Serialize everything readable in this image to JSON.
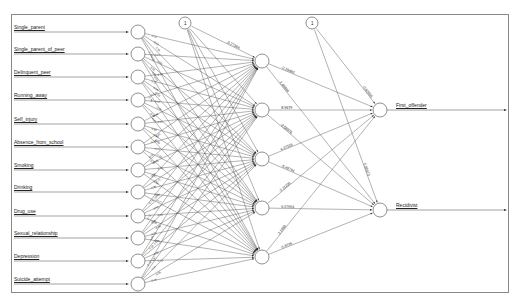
{
  "diagram": {
    "type": "neural-network",
    "bias_label": "1",
    "inputs": [
      {
        "label": "Single_parent",
        "y": 32
      },
      {
        "label": "Single_parent_of_peer",
        "y": 54
      },
      {
        "label": "Delinquent_peer",
        "y": 77
      },
      {
        "label": "Running_away",
        "y": 100
      },
      {
        "label": "Self_injury",
        "y": 124
      },
      {
        "label": "Absence_from_school",
        "y": 147
      },
      {
        "label": "Smoking",
        "y": 170
      },
      {
        "label": "Drinking",
        "y": 192
      },
      {
        "label": "Drug_use",
        "y": 216
      },
      {
        "label": "Sexual_relationship",
        "y": 238
      },
      {
        "label": "Depression",
        "y": 261
      },
      {
        "label": "Suicide_attempt",
        "y": 284
      }
    ],
    "hidden": [
      {
        "y": 61
      },
      {
        "y": 110
      },
      {
        "y": 159
      },
      {
        "y": 208
      },
      {
        "y": 257
      }
    ],
    "outputs": [
      {
        "label": "First_offender",
        "y": 110
      },
      {
        "label": "Recidivist",
        "y": 210
      }
    ],
    "weight_labels": {
      "bias1_h1": "-0.27384",
      "in1_h1": "-1.2889",
      "in2_h1": "-1.09238",
      "in11_h5": "-0.48743",
      "in12_h5": "-2.38386",
      "h1_o1": "-2.36482",
      "h1_o2": "1.48684",
      "h2_o1": "8.9679",
      "h2_o2": "-3.58976",
      "h3_o1": "4.27516",
      "h3_o2": "-5.49744",
      "h4_o1": "-2.11236",
      "h4_o2": "6.57664",
      "h5_o1": "3.1966",
      "h5_o2": "-3.6736",
      "bias2_o1": "-0.62565",
      "bias2_o2": "0.80573"
    }
  }
}
